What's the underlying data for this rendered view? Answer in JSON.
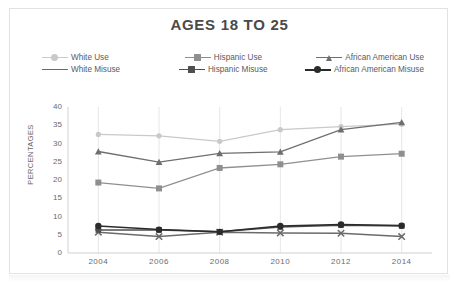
{
  "chart_data": {
    "type": "line",
    "title": "AGES 18 TO 25",
    "xlabel": "",
    "ylabel": "PERCENTAGES",
    "categories": [
      "2004",
      "2006",
      "2008",
      "2010",
      "2012",
      "2014"
    ],
    "ylim": [
      0,
      40
    ],
    "yticks": [
      "0",
      "5",
      "10",
      "15",
      "20",
      "25",
      "30",
      "35",
      "40"
    ],
    "grid": "vertical",
    "legend_position": "top",
    "series": [
      {
        "name": "White Use",
        "marker": "circle",
        "color": "#c9c9c9",
        "values": [
          32.5,
          32.1,
          30.6,
          33.8,
          34.6,
          35.3
        ]
      },
      {
        "name": "Hispanic Use",
        "marker": "square",
        "color": "#8f8f8f",
        "values": [
          19.3,
          17.7,
          23.3,
          24.3,
          26.4,
          27.2
        ]
      },
      {
        "name": "African American Use",
        "marker": "triangle",
        "color": "#6e6e6e",
        "values": [
          27.8,
          24.9,
          27.3,
          27.7,
          33.8,
          35.8
        ]
      },
      {
        "name": "White Misuse",
        "marker": "x",
        "color": "#6b6b6b",
        "values": [
          5.7,
          4.5,
          5.7,
          5.5,
          5.4,
          4.5
        ]
      },
      {
        "name": "Hispanic Misuse",
        "marker": "square",
        "color": "#4f4f4f",
        "values": [
          6.3,
          6.3,
          5.8,
          7.1,
          7.6,
          7.4
        ]
      },
      {
        "name": "African American Misuse",
        "marker": "circle",
        "color": "#2b2b2b",
        "values": [
          7.4,
          6.4,
          5.8,
          7.4,
          7.8,
          7.5
        ]
      }
    ]
  },
  "axis": {
    "y_title": "PERCENTAGES"
  }
}
